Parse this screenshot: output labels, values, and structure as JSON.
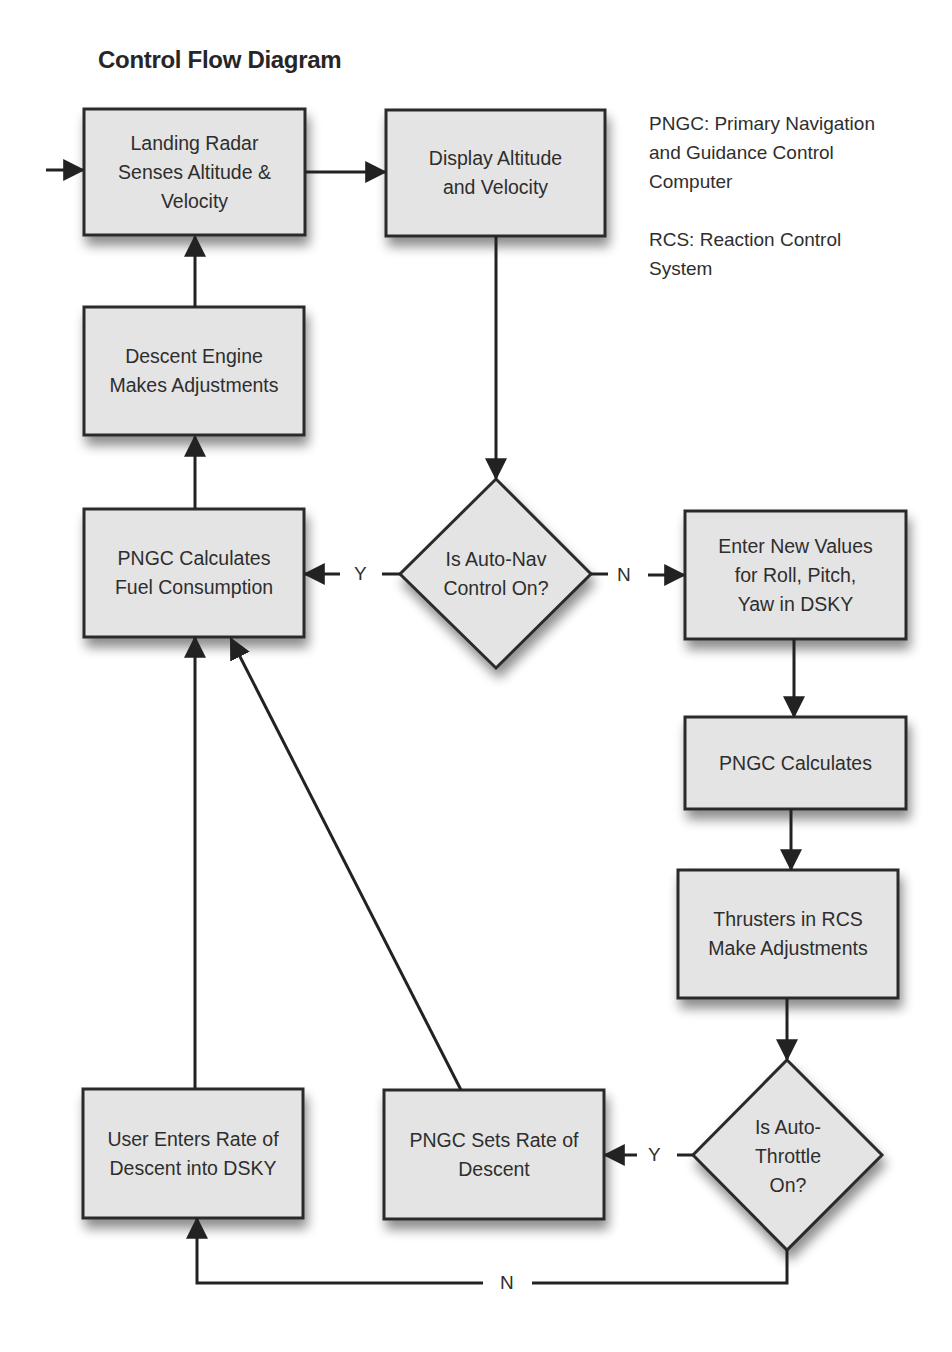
{
  "page": {
    "running_header": "",
    "title": "Control Flow Diagram"
  },
  "legend": [
    {
      "id": "pngc",
      "text": "PNGC: Primary Navigation\nand Guidance Control\nComputer"
    },
    {
      "id": "rcs",
      "text": "RCS: Reaction Control\nSystem"
    }
  ],
  "colors": {
    "box_fill": "#e4e4e4",
    "box_stroke": "#2a2a2a",
    "line": "#222222",
    "text": "#2e2e2e",
    "background": "#ffffff"
  },
  "nodes": {
    "landing_radar": {
      "type": "process",
      "text": "Landing Radar\nSenses Altitude &\nVelocity"
    },
    "display_alt": {
      "type": "process",
      "text": "Display Altitude\nand Velocity"
    },
    "descent_engine": {
      "type": "process",
      "text": "Descent Engine\nMakes Adjustments"
    },
    "pngc_fuel": {
      "type": "process",
      "text": "PNGC Calculates\nFuel Consumption"
    },
    "auto_nav": {
      "type": "decision",
      "text": "Is Auto-Nav\nControl On?"
    },
    "enter_values": {
      "type": "process",
      "text": "Enter New Values\nfor Roll, Pitch,\nYaw in DSKY"
    },
    "pngc_calc": {
      "type": "process",
      "text": "PNGC Calculates"
    },
    "thrusters": {
      "type": "process",
      "text": "Thrusters in RCS\nMake Adjustments"
    },
    "auto_throttle": {
      "type": "decision",
      "text": "Is Auto-\nThrottle\nOn?"
    },
    "pngc_sets": {
      "type": "process",
      "text": "PNGC Sets Rate of\nDescent"
    },
    "user_enters": {
      "type": "process",
      "text": "User Enters Rate of\nDescent into DSKY"
    }
  },
  "edge_labels": {
    "auto_nav_yes": "Y",
    "auto_nav_no": "N",
    "auto_throttle_yes": "Y",
    "auto_throttle_no": "N"
  },
  "edges": [
    {
      "from": "external",
      "to": "landing_radar"
    },
    {
      "from": "landing_radar",
      "to": "display_alt"
    },
    {
      "from": "display_alt",
      "to": "auto_nav"
    },
    {
      "from": "auto_nav",
      "to": "pngc_fuel",
      "label": "Y"
    },
    {
      "from": "auto_nav",
      "to": "enter_values",
      "label": "N"
    },
    {
      "from": "pngc_fuel",
      "to": "descent_engine"
    },
    {
      "from": "descent_engine",
      "to": "landing_radar"
    },
    {
      "from": "enter_values",
      "to": "pngc_calc"
    },
    {
      "from": "pngc_calc",
      "to": "thrusters"
    },
    {
      "from": "thrusters",
      "to": "auto_throttle"
    },
    {
      "from": "auto_throttle",
      "to": "pngc_sets",
      "label": "Y"
    },
    {
      "from": "auto_throttle",
      "to": "user_enters",
      "label": "N"
    },
    {
      "from": "pngc_sets",
      "to": "pngc_fuel"
    },
    {
      "from": "user_enters",
      "to": "pngc_fuel"
    }
  ]
}
